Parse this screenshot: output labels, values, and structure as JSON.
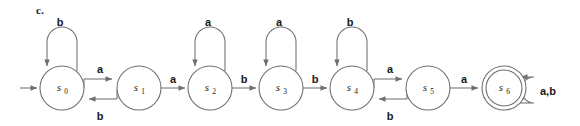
{
  "figure": {
    "part_label": "c.",
    "geometry": {
      "width": 580,
      "height": 126,
      "node_radius": 22,
      "node_center_y": 88,
      "accept_inner_radius": 18
    },
    "colors": {
      "stroke": "#6f6f6f",
      "text": "#171717",
      "background": "#ffffff"
    }
  },
  "automaton": {
    "type": "finite-state-machine",
    "alphabet": [
      "a",
      "b"
    ],
    "start_state": "s0",
    "accept_states": [
      "s6"
    ],
    "states": [
      {
        "id": "s0",
        "label": "s",
        "subscript": "0",
        "cx": 62,
        "cy": 88,
        "accepting": false,
        "start": true
      },
      {
        "id": "s1",
        "label": "s",
        "subscript": "1",
        "cx": 139,
        "cy": 88,
        "accepting": false,
        "start": false
      },
      {
        "id": "s2",
        "label": "s",
        "subscript": "2",
        "cx": 210,
        "cy": 88,
        "accepting": false,
        "start": false
      },
      {
        "id": "s3",
        "label": "s",
        "subscript": "3",
        "cx": 281,
        "cy": 88,
        "accepting": false,
        "start": false
      },
      {
        "id": "s4",
        "label": "s",
        "subscript": "4",
        "cx": 352,
        "cy": 88,
        "accepting": false,
        "start": false
      },
      {
        "id": "s5",
        "label": "s",
        "subscript": "5",
        "cx": 428,
        "cy": 88,
        "accepting": false,
        "start": false
      },
      {
        "id": "s6",
        "label": "s",
        "subscript": "6",
        "cx": 504,
        "cy": 88,
        "accepting": true,
        "start": false
      }
    ],
    "transitions": [
      {
        "from": "s0",
        "to": "s0",
        "symbol": "b",
        "kind": "self-loop-top",
        "label_x": 60,
        "label_y": 22
      },
      {
        "from": "s0",
        "to": "s1",
        "symbol": "a",
        "kind": "forward-upper",
        "label_x": 100,
        "label_y": 70
      },
      {
        "from": "s1",
        "to": "s0",
        "symbol": "b",
        "kind": "back-lower",
        "label_x": 100,
        "label_y": 118
      },
      {
        "from": "s1",
        "to": "s2",
        "symbol": "a",
        "kind": "forward",
        "label_x": 175,
        "label_y": 84
      },
      {
        "from": "s2",
        "to": "s2",
        "symbol": "a",
        "kind": "self-loop-top",
        "label_x": 208,
        "label_y": 22
      },
      {
        "from": "s2",
        "to": "s3",
        "symbol": "b",
        "kind": "forward",
        "label_x": 246,
        "label_y": 84
      },
      {
        "from": "s3",
        "to": "s3",
        "symbol": "a",
        "kind": "self-loop-top",
        "label_x": 279,
        "label_y": 22
      },
      {
        "from": "s3",
        "to": "s4",
        "symbol": "b",
        "kind": "forward",
        "label_x": 317,
        "label_y": 84
      },
      {
        "from": "s4",
        "to": "s4",
        "symbol": "b",
        "kind": "self-loop-top",
        "label_x": 350,
        "label_y": 22
      },
      {
        "from": "s4",
        "to": "s5",
        "symbol": "a",
        "kind": "forward-upper",
        "label_x": 390,
        "label_y": 70
      },
      {
        "from": "s5",
        "to": "s4",
        "symbol": "b",
        "kind": "back-lower",
        "label_x": 390,
        "label_y": 118
      },
      {
        "from": "s5",
        "to": "s6",
        "symbol": "a",
        "kind": "forward",
        "label_x": 466,
        "label_y": 84
      },
      {
        "from": "s6",
        "to": "s6",
        "symbol": "a,b",
        "kind": "self-loop-right",
        "label_x": 553,
        "label_y": 92
      }
    ],
    "start_arrow": {
      "x1": 20,
      "y1": 88,
      "x2": 38,
      "y2": 88
    }
  }
}
